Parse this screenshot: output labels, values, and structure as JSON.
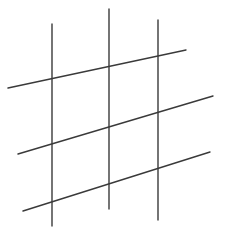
{
  "figure": {
    "caption_fragment": "",
    "stroke_color": "#3a3a3a",
    "stroke_width": 1.4,
    "vertical_lines": [
      {
        "x1": 52,
        "y1": 24,
        "x2": 52,
        "y2": 226
      },
      {
        "x1": 109,
        "y1": 9,
        "x2": 109,
        "y2": 209
      },
      {
        "x1": 158,
        "y1": 20,
        "x2": 158,
        "y2": 220
      }
    ],
    "oblique_lines": [
      {
        "x1": 8,
        "y1": 88,
        "x2": 186,
        "y2": 50
      },
      {
        "x1": 18,
        "y1": 154,
        "x2": 213,
        "y2": 96
      },
      {
        "x1": 23,
        "y1": 211,
        "x2": 210,
        "y2": 152
      }
    ]
  }
}
